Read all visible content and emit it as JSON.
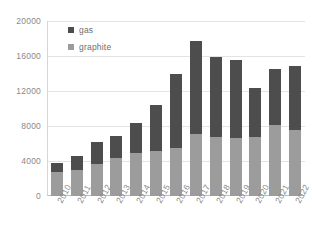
{
  "chart_data": {
    "type": "bar",
    "stacked": true,
    "title": "",
    "xlabel": "",
    "ylabel": "",
    "categories": [
      "2010",
      "2011",
      "2012",
      "2013",
      "2014",
      "2015",
      "2016",
      "2017",
      "2018",
      "2019",
      "2020",
      "2021",
      "2022"
    ],
    "series": [
      {
        "name": "graphite",
        "color": "#9c9c9c",
        "values": [
          2700,
          3000,
          3700,
          4400,
          4900,
          5100,
          5500,
          7100,
          6800,
          6600,
          6700,
          8100,
          7500
        ]
      },
      {
        "name": "gas",
        "color": "#4d4d4d",
        "values": [
          1100,
          1600,
          2500,
          2500,
          3400,
          5300,
          8400,
          10600,
          9100,
          9000,
          5600,
          6400,
          7400
        ]
      }
    ],
    "totals": [
      3800,
      4600,
      6200,
      6900,
      8300,
      10400,
      13900,
      17700,
      15900,
      15600,
      12300,
      14500,
      14900
    ],
    "ylim": [
      0,
      20000
    ],
    "yticks": [
      0,
      4000,
      8000,
      12000,
      16000,
      20000
    ],
    "ytick_labels": [
      "0",
      "4000",
      "8000",
      "12000",
      "16000",
      "20000"
    ],
    "grid": true,
    "legend_position": "top-left",
    "legend_entries": [
      "gas",
      "graphite"
    ]
  },
  "legend": {
    "items": [
      {
        "label": "gas",
        "swatch": "legend-swatch-gas"
      },
      {
        "label": "graphite",
        "swatch": "legend-swatch-graphite"
      }
    ]
  }
}
